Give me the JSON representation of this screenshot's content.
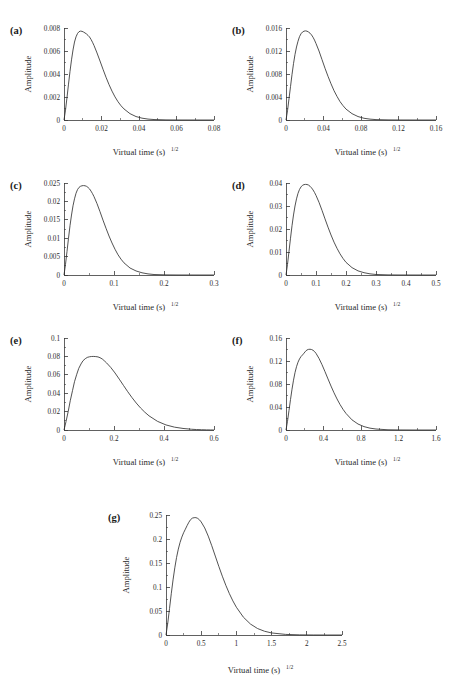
{
  "figure": {
    "background_color": "#ffffff",
    "curve_color": "#333333",
    "axis_color": "#3a3a3a",
    "text_color": "#2b2b2b",
    "shared_xlabel_base": "Virtual time (s)",
    "shared_xlabel_sup": "1/2",
    "shared_ylabel": "Amplitude",
    "header_text": ""
  },
  "chart_data": [
    {
      "type": "line",
      "panel": "a",
      "label": "(a)",
      "title": "",
      "xlabel": "Virtual time (s)^1/2",
      "ylabel": "Amplitude",
      "xlim": [
        0,
        0.08
      ],
      "ylim": [
        0,
        0.008
      ],
      "xticks": [
        0,
        0.02,
        0.04,
        0.06,
        0.08
      ],
      "xticklabels": [
        "0",
        "0.02",
        "0.04",
        "0.06",
        "0.08"
      ],
      "yticks": [
        0,
        0.002,
        0.004,
        0.006,
        0.008
      ],
      "yticklabels": [
        "0",
        "0.002",
        "0.004",
        "0.006",
        "0.008"
      ],
      "grid": false,
      "legend": false,
      "peak_x": 0.0135,
      "peak_y": 0.0077,
      "x": [
        0,
        0.0008,
        0.0016,
        0.0024,
        0.0032,
        0.004,
        0.0048,
        0.0056,
        0.0064,
        0.0072,
        0.008,
        0.0088,
        0.0096,
        0.0104,
        0.0112,
        0.012,
        0.0128,
        0.0136,
        0.0144,
        0.0152,
        0.016,
        0.0176,
        0.0192,
        0.0208,
        0.0224,
        0.024,
        0.0256,
        0.0272,
        0.0288,
        0.0304,
        0.032,
        0.0352,
        0.0384,
        0.0416,
        0.0448,
        0.048,
        0.0544,
        0.0608,
        0.0672,
        0.0736,
        0.08
      ],
      "y": [
        0,
        0.00086,
        0.00196,
        0.00312,
        0.00423,
        0.00523,
        0.00609,
        0.00678,
        0.00723,
        0.00752,
        0.00768,
        0.00773,
        0.00771,
        0.00765,
        0.00757,
        0.00748,
        0.00736,
        0.00722,
        0.00701,
        0.00676,
        0.00648,
        0.00583,
        0.00513,
        0.00441,
        0.00372,
        0.00308,
        0.00251,
        0.00201,
        0.00159,
        0.00124,
        0.00096,
        0.00055,
        0.0003,
        0.00016,
        8e-05,
        4e-05,
        1e-05,
        3e-06,
        1e-06,
        3e-07,
        0
      ]
    },
    {
      "type": "line",
      "panel": "b",
      "label": "(b)",
      "title": "",
      "xlabel": "Virtual time (s)^1/2",
      "ylabel": "Amplitude",
      "xlim": [
        0,
        0.16
      ],
      "ylim": [
        0,
        0.016
      ],
      "xticks": [
        0,
        0.04,
        0.08,
        0.12,
        0.16
      ],
      "xticklabels": [
        "0",
        "0.04",
        "0.08",
        "0.12",
        "0.16"
      ],
      "yticks": [
        0,
        0.004,
        0.008,
        0.012,
        0.016
      ],
      "yticklabels": [
        "0",
        "0.004",
        "0.008",
        "0.012",
        "0.016"
      ],
      "grid": false,
      "legend": false,
      "peak_x": 0.026,
      "peak_y": 0.0155,
      "x": [
        0,
        0.0016,
        0.0032,
        0.0048,
        0.0064,
        0.008,
        0.0096,
        0.0112,
        0.0128,
        0.0144,
        0.016,
        0.0176,
        0.0192,
        0.0208,
        0.0224,
        0.024,
        0.0256,
        0.0272,
        0.0288,
        0.0304,
        0.032,
        0.0352,
        0.0384,
        0.0416,
        0.0448,
        0.048,
        0.0512,
        0.0544,
        0.0576,
        0.0608,
        0.064,
        0.0704,
        0.0768,
        0.0832,
        0.0896,
        0.096,
        0.1088,
        0.1216,
        0.1344,
        0.1472,
        0.16
      ],
      "y": [
        0,
        0.0016,
        0.0037,
        0.0058,
        0.0079,
        0.0098,
        0.0114,
        0.0127,
        0.0137,
        0.0145,
        0.015,
        0.0153,
        0.01545,
        0.0155,
        0.01545,
        0.0153,
        0.0151,
        0.0148,
        0.0144,
        0.0139,
        0.0133,
        0.012,
        0.0105,
        0.009,
        0.0076,
        0.0063,
        0.0051,
        0.0041,
        0.0032,
        0.0025,
        0.0019,
        0.0011,
        0.0006,
        0.0003,
        0.00015,
        7e-05,
        2e-05,
        5e-06,
        1e-06,
        3e-07,
        0
      ]
    },
    {
      "type": "line",
      "panel": "c",
      "label": "(c)",
      "title": "",
      "xlabel": "Virtual time (s)^1/2",
      "ylabel": "Amplitude",
      "xlim": [
        0,
        0.3
      ],
      "ylim": [
        0,
        0.025
      ],
      "xticks": [
        0,
        0.1,
        0.2,
        0.3
      ],
      "xticklabels": [
        "0",
        "0.1",
        "0.2",
        "0.3"
      ],
      "yticks": [
        0,
        0.005,
        0.01,
        0.015,
        0.02,
        0.025
      ],
      "yticklabels": [
        "0",
        "0.005",
        "0.01",
        "0.015",
        "0.02",
        "0.025"
      ],
      "grid": false,
      "legend": false,
      "peak_x": 0.041,
      "peak_y": 0.0243,
      "x": [
        0,
        0.003,
        0.006,
        0.009,
        0.012,
        0.015,
        0.018,
        0.021,
        0.024,
        0.027,
        0.03,
        0.033,
        0.036,
        0.039,
        0.042,
        0.045,
        0.048,
        0.051,
        0.054,
        0.057,
        0.06,
        0.066,
        0.072,
        0.078,
        0.084,
        0.09,
        0.096,
        0.102,
        0.108,
        0.114,
        0.12,
        0.132,
        0.144,
        0.156,
        0.168,
        0.18,
        0.204,
        0.228,
        0.252,
        0.276,
        0.3
      ],
      "y": [
        0,
        0.0029,
        0.0064,
        0.01,
        0.0134,
        0.0163,
        0.0188,
        0.0207,
        0.0222,
        0.0232,
        0.0238,
        0.0241,
        0.02425,
        0.0243,
        0.02425,
        0.0241,
        0.0238,
        0.0234,
        0.0228,
        0.0221,
        0.0213,
        0.0194,
        0.0172,
        0.0149,
        0.0127,
        0.0106,
        0.0087,
        0.007,
        0.0055,
        0.0043,
        0.0033,
        0.0019,
        0.0011,
        0.0006,
        0.0003,
        0.00013,
        3e-05,
        7e-06,
        2e-06,
        4e-07,
        0
      ]
    },
    {
      "type": "line",
      "panel": "d",
      "label": "(d)",
      "title": "",
      "xlabel": "Virtual time (s)^1/2",
      "ylabel": "Amplitude",
      "xlim": [
        0,
        0.5
      ],
      "ylim": [
        0,
        0.04
      ],
      "xticks": [
        0,
        0.1,
        0.2,
        0.3,
        0.4,
        0.5
      ],
      "xticklabels": [
        "0",
        "0.1",
        "0.2",
        "0.3",
        "0.4",
        "0.5"
      ],
      "yticks": [
        0,
        0.01,
        0.02,
        0.03,
        0.04
      ],
      "yticklabels": [
        "0",
        "0.01",
        "0.02",
        "0.03",
        "0.04"
      ],
      "grid": false,
      "legend": false,
      "peak_x": 0.068,
      "peak_y": 0.0394,
      "x": [
        0,
        0.005,
        0.01,
        0.015,
        0.02,
        0.025,
        0.03,
        0.035,
        0.04,
        0.045,
        0.05,
        0.055,
        0.06,
        0.065,
        0.07,
        0.075,
        0.08,
        0.085,
        0.09,
        0.095,
        0.1,
        0.11,
        0.12,
        0.13,
        0.14,
        0.15,
        0.16,
        0.17,
        0.18,
        0.19,
        0.2,
        0.22,
        0.24,
        0.26,
        0.28,
        0.3,
        0.34,
        0.38,
        0.42,
        0.46,
        0.5
      ],
      "y": [
        0,
        0.0046,
        0.0103,
        0.016,
        0.0214,
        0.0261,
        0.03,
        0.0331,
        0.0355,
        0.0372,
        0.0383,
        0.039,
        0.0393,
        0.0394,
        0.03935,
        0.0391,
        0.0386,
        0.0379,
        0.037,
        0.0359,
        0.0346,
        0.0316,
        0.0281,
        0.0244,
        0.0208,
        0.0174,
        0.0143,
        0.0116,
        0.0092,
        0.0072,
        0.0055,
        0.0032,
        0.0018,
        0.001,
        0.0005,
        0.00022,
        5e-05,
        1e-05,
        3e-06,
        6e-07,
        0
      ]
    },
    {
      "type": "line",
      "panel": "e",
      "label": "(e)",
      "title": "",
      "xlabel": "Virtual time (s)^1/2",
      "ylabel": "Amplitude",
      "xlim": [
        0,
        0.6
      ],
      "ylim": [
        0,
        0.1
      ],
      "xticks": [
        0,
        0.2,
        0.4,
        0.6
      ],
      "xticklabels": [
        "0",
        "0.2",
        "0.4",
        "0.6"
      ],
      "yticks": [
        0,
        0.02,
        0.04,
        0.06,
        0.08,
        0.1
      ],
      "yticklabels": [
        "0",
        "0.02",
        "0.04",
        "0.06",
        "0.08",
        "0.1"
      ],
      "grid": false,
      "legend": false,
      "peak_x": 0.135,
      "peak_y": 0.08,
      "x": [
        0,
        0.008,
        0.017,
        0.025,
        0.034,
        0.042,
        0.051,
        0.059,
        0.068,
        0.076,
        0.085,
        0.093,
        0.102,
        0.11,
        0.119,
        0.127,
        0.136,
        0.144,
        0.153,
        0.161,
        0.17,
        0.187,
        0.204,
        0.221,
        0.238,
        0.255,
        0.272,
        0.289,
        0.306,
        0.323,
        0.34,
        0.374,
        0.408,
        0.442,
        0.476,
        0.51,
        0.53,
        0.55,
        0.57,
        0.585,
        0.6
      ],
      "y": [
        0,
        0.0091,
        0.0204,
        0.0318,
        0.0428,
        0.0525,
        0.0606,
        0.067,
        0.0718,
        0.0753,
        0.0775,
        0.0789,
        0.0796,
        0.0799,
        0.07995,
        0.0798,
        0.07945,
        0.0786,
        0.0772,
        0.0753,
        0.073,
        0.068,
        0.062,
        0.0553,
        0.0484,
        0.0416,
        0.0352,
        0.0293,
        0.024,
        0.0194,
        0.0154,
        0.0094,
        0.0055,
        0.0031,
        0.0017,
        0.0008,
        0.0005,
        0.0003,
        0.00015,
        7e-05,
        0
      ]
    },
    {
      "type": "line",
      "panel": "f",
      "label": "(f)",
      "title": "",
      "xlabel": "Virtual time (s)^1/2",
      "ylabel": "Amplitude",
      "xlim": [
        0,
        1.6
      ],
      "ylim": [
        0,
        0.16
      ],
      "xticks": [
        0,
        0.4,
        0.8,
        1.2,
        1.6
      ],
      "xticklabels": [
        "0",
        "0.4",
        "0.8",
        "1.2",
        "1.6"
      ],
      "yticks": [
        0,
        0.04,
        0.08,
        0.12,
        0.16
      ],
      "yticklabels": [
        "0",
        "0.04",
        "0.08",
        "0.12",
        "0.16"
      ],
      "grid": false,
      "legend": false,
      "peak_x": 0.245,
      "peak_y": 0.1405,
      "x": [
        0,
        0.016,
        0.032,
        0.048,
        0.064,
        0.08,
        0.096,
        0.112,
        0.128,
        0.144,
        0.16,
        0.176,
        0.192,
        0.208,
        0.224,
        0.24,
        0.256,
        0.272,
        0.288,
        0.304,
        0.32,
        0.352,
        0.384,
        0.416,
        0.448,
        0.48,
        0.512,
        0.544,
        0.576,
        0.608,
        0.64,
        0.704,
        0.768,
        0.832,
        0.896,
        0.96,
        1.088,
        1.216,
        1.344,
        1.472,
        1.6
      ],
      "y": [
        0,
        0.0152,
        0.034,
        0.053,
        0.0709,
        0.0866,
        0.0998,
        0.1101,
        0.1179,
        0.1236,
        0.1277,
        0.1305,
        0.1336,
        0.1369,
        0.1392,
        0.1402,
        0.14045,
        0.14,
        0.1387,
        0.1365,
        0.1333,
        0.1245,
        0.1136,
        0.1014,
        0.0888,
        0.0764,
        0.0647,
        0.054,
        0.0444,
        0.036,
        0.0288,
        0.0176,
        0.0104,
        0.0059,
        0.0032,
        0.0017,
        0.0004,
        0.0001,
        2e-05,
        4e-06,
        0
      ]
    },
    {
      "type": "line",
      "panel": "g",
      "label": "(g)",
      "title": "",
      "xlabel": "Virtual time (s)^1/2",
      "ylabel": "Amplitude",
      "xlim": [
        0,
        2.5
      ],
      "ylim": [
        0,
        0.25
      ],
      "xticks": [
        0,
        0.5,
        1,
        1.5,
        2,
        2.5
      ],
      "xticklabels": [
        "0",
        "0.5",
        "1",
        "1.5",
        "2",
        "2.5"
      ],
      "yticks": [
        0,
        0.05,
        0.1,
        0.15,
        0.2,
        0.25
      ],
      "yticklabels": [
        "0",
        "0.05",
        "0.1",
        "0.15",
        "0.2",
        "0.25"
      ],
      "grid": false,
      "legend": false,
      "peak_x": 0.41,
      "peak_y": 0.2445,
      "x": [
        0,
        0.025,
        0.05,
        0.075,
        0.1,
        0.125,
        0.15,
        0.175,
        0.2,
        0.225,
        0.25,
        0.275,
        0.3,
        0.325,
        0.35,
        0.375,
        0.4,
        0.425,
        0.45,
        0.475,
        0.5,
        0.55,
        0.6,
        0.65,
        0.7,
        0.75,
        0.8,
        0.85,
        0.9,
        0.95,
        1.0,
        1.1,
        1.2,
        1.3,
        1.4,
        1.5,
        1.7,
        1.9,
        2.1,
        2.3,
        2.5
      ],
      "y": [
        0,
        0.0247,
        0.0552,
        0.086,
        0.1148,
        0.14,
        0.1615,
        0.179,
        0.193,
        0.204,
        0.213,
        0.2205,
        0.228,
        0.235,
        0.2405,
        0.2435,
        0.24445,
        0.2445,
        0.243,
        0.24,
        0.2355,
        0.223,
        0.206,
        0.186,
        0.1645,
        0.143,
        0.1225,
        0.1035,
        0.0862,
        0.071,
        0.0578,
        0.037,
        0.0228,
        0.0135,
        0.0078,
        0.0043,
        0.0012,
        0.0003,
        7e-05,
        1e-05,
        0
      ]
    }
  ],
  "panels": [
    {
      "letter": "(a)",
      "name": "panel-a"
    },
    {
      "letter": "(b)",
      "name": "panel-b"
    },
    {
      "letter": "(c)",
      "name": "panel-c"
    },
    {
      "letter": "(d)",
      "name": "panel-d"
    },
    {
      "letter": "(e)",
      "name": "panel-e"
    },
    {
      "letter": "(f)",
      "name": "panel-f"
    },
    {
      "letter": "(g)",
      "name": "panel-g"
    }
  ],
  "panel_positions": [
    {
      "left": 8,
      "top": 14,
      "w": 216,
      "h": 150
    },
    {
      "left": 230,
      "top": 14,
      "w": 216,
      "h": 150
    },
    {
      "left": 8,
      "top": 169,
      "w": 216,
      "h": 150
    },
    {
      "left": 230,
      "top": 169,
      "w": 216,
      "h": 150
    },
    {
      "left": 8,
      "top": 324,
      "w": 216,
      "h": 150
    },
    {
      "left": 230,
      "top": 324,
      "w": 216,
      "h": 150
    },
    {
      "left": 104,
      "top": 497,
      "w": 250,
      "h": 190
    }
  ]
}
